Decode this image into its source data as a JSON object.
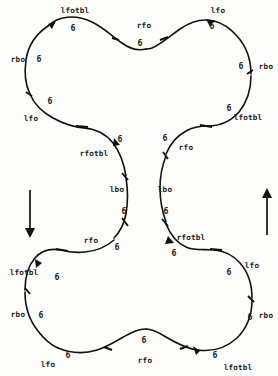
{
  "figure": {
    "stroke_color": "#111111",
    "background_color": "#fdfdfc",
    "width": 278,
    "height": 376,
    "edge_labels": [
      {
        "id": "top-lobe-upper-left-lfotbl",
        "text": "lfotbl",
        "x": 75,
        "y": 11
      },
      {
        "id": "top-lobe-upper-right-lfo",
        "text": "lfo",
        "x": 218,
        "y": 11
      },
      {
        "id": "top-center-rfo",
        "text": "rfo",
        "x": 144,
        "y": 26
      },
      {
        "id": "top-left-rbo",
        "text": "rbo",
        "x": 18,
        "y": 60
      },
      {
        "id": "top-right-rbo",
        "text": "rbo",
        "x": 266,
        "y": 67
      },
      {
        "id": "upper-left-lfo",
        "text": "lfo",
        "x": 31,
        "y": 119
      },
      {
        "id": "upper-right-lfotbl",
        "text": "lfotbl",
        "x": 248,
        "y": 118
      },
      {
        "id": "waist-left-rfotbl",
        "text": "rfotbl",
        "x": 94,
        "y": 154
      },
      {
        "id": "waist-right-rfo",
        "text": "rfo",
        "x": 186,
        "y": 148
      },
      {
        "id": "waist-left-lbo",
        "text": "lbo",
        "x": 117,
        "y": 190
      },
      {
        "id": "waist-right-lbo",
        "text": "lbo",
        "x": 165,
        "y": 190
      },
      {
        "id": "waist-left-rfo",
        "text": "rfo",
        "x": 91,
        "y": 241
      },
      {
        "id": "waist-right-rfotbl",
        "text": "rfotbl",
        "x": 191,
        "y": 238
      },
      {
        "id": "lower-left-lfotbl",
        "text": "lfotbl",
        "x": 24,
        "y": 273
      },
      {
        "id": "lower-right-lfo",
        "text": "lfo",
        "x": 252,
        "y": 266
      },
      {
        "id": "bottom-left-rbo",
        "text": "rbo",
        "x": 18,
        "y": 315
      },
      {
        "id": "bottom-right-rbo",
        "text": "rbo",
        "x": 266,
        "y": 316
      },
      {
        "id": "bottom-lower-left-lfo",
        "text": "lfo",
        "x": 48,
        "y": 365
      },
      {
        "id": "bottom-center-rfo",
        "text": "rfo",
        "x": 145,
        "y": 361
      },
      {
        "id": "bottom-right-lfotbl",
        "text": "lfotbl",
        "x": 238,
        "y": 368
      }
    ],
    "count_labels": [
      {
        "id": "count-top-left",
        "text": "6",
        "x": 73,
        "y": 28
      },
      {
        "id": "count-top-right",
        "text": "6",
        "x": 212,
        "y": 26
      },
      {
        "id": "count-top-center",
        "text": "6",
        "x": 140,
        "y": 43
      },
      {
        "id": "count-left-upper",
        "text": "6",
        "x": 39,
        "y": 59
      },
      {
        "id": "count-right-upper",
        "text": "6",
        "x": 241,
        "y": 66
      },
      {
        "id": "count-left-mid",
        "text": "6",
        "x": 50,
        "y": 101
      },
      {
        "id": "count-right-mid",
        "text": "6",
        "x": 229,
        "y": 108
      },
      {
        "id": "count-waist-left-upper",
        "text": "6",
        "x": 120,
        "y": 139
      },
      {
        "id": "count-waist-right-upper",
        "text": "6",
        "x": 165,
        "y": 138
      },
      {
        "id": "count-waist-left-lower",
        "text": "6",
        "x": 124,
        "y": 211
      },
      {
        "id": "count-waist-right-lower",
        "text": "6",
        "x": 166,
        "y": 211
      },
      {
        "id": "count-waist-left-bot",
        "text": "6",
        "x": 117,
        "y": 247
      },
      {
        "id": "count-waist-right-bot",
        "text": "6",
        "x": 174,
        "y": 253
      },
      {
        "id": "count-lower-left",
        "text": "6",
        "x": 57,
        "y": 277
      },
      {
        "id": "count-lower-right",
        "text": "6",
        "x": 229,
        "y": 272
      },
      {
        "id": "count-bottom-left",
        "text": "6",
        "x": 41,
        "y": 315
      },
      {
        "id": "count-bottom-right",
        "text": "6",
        "x": 250,
        "y": 317
      },
      {
        "id": "count-bottom-mid-left",
        "text": "6",
        "x": 68,
        "y": 355
      },
      {
        "id": "count-bottom-center",
        "text": "6",
        "x": 144,
        "y": 340
      },
      {
        "id": "count-bottom-mid-right",
        "text": "6",
        "x": 215,
        "y": 355
      }
    ],
    "direction_arrows": [
      {
        "id": "left-direction-arrow",
        "direction": "down",
        "x": 30,
        "y1": 190,
        "y2": 235
      },
      {
        "id": "right-direction-arrow",
        "direction": "up",
        "x": 267,
        "y1": 235,
        "y2": 190
      }
    ]
  }
}
